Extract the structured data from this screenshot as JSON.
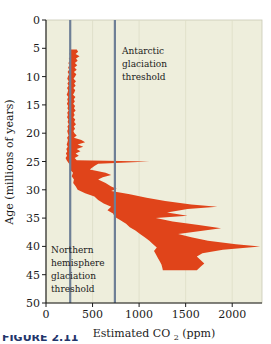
{
  "figure": {
    "background_color": "#ffffff",
    "plot_background_color": "#eeeedc",
    "caption_partial": "FIGURE 2.11"
  },
  "annotations": {
    "antarctic": {
      "line1": "Antarctic",
      "line2": "glaciation",
      "line3": "threshold"
    },
    "northern": {
      "line1": "Northern",
      "line2": "hemisphere",
      "line3": "glaciation",
      "line4": "threshold"
    }
  },
  "chart_data": {
    "type": "area",
    "title": "",
    "subtitle": "",
    "xlabel": "Estimated CO",
    "xlabel_sub": "2",
    "xlabel_unit": "(ppm)",
    "xlabel_full": "Estimated CO2 (ppm)",
    "ylabel": "Age (millions of years)",
    "xlim": [
      0,
      2320
    ],
    "ylim": [
      0,
      50
    ],
    "y_inverted": true,
    "grid": false,
    "legend_position": "none",
    "x_ticks": [
      0,
      500,
      1000,
      1500,
      2000
    ],
    "x_tick_labels": [
      "0",
      "500",
      "1000",
      "1500",
      "2000"
    ],
    "y_ticks": [
      0,
      5,
      10,
      15,
      20,
      25,
      30,
      35,
      40,
      45,
      50
    ],
    "y_tick_labels": [
      "0",
      "5",
      "10",
      "15",
      "20",
      "25",
      "30",
      "35",
      "40",
      "45",
      "50"
    ],
    "band_color": "#e0441a",
    "threshold_color": "#6e7f96",
    "thresholds": [
      {
        "name": "Northern hemisphere glaciation threshold",
        "value": 260
      },
      {
        "name": "Antarctic glaciation threshold",
        "value": 740
      }
    ],
    "series": [
      {
        "name": "Estimated CO2 uncertainty band (lower bound)",
        "axis": "x",
        "points": [
          [
            5.2,
            255
          ],
          [
            5.6,
            262
          ],
          [
            6.0,
            250
          ],
          [
            6.4,
            268
          ],
          [
            6.8,
            245
          ],
          [
            7.2,
            258
          ],
          [
            7.6,
            240
          ],
          [
            8.0,
            252
          ],
          [
            8.4,
            238
          ],
          [
            8.8,
            248
          ],
          [
            9.2,
            232
          ],
          [
            9.6,
            246
          ],
          [
            10.0,
            236
          ],
          [
            10.4,
            228
          ],
          [
            10.8,
            244
          ],
          [
            11.2,
            230
          ],
          [
            11.6,
            242
          ],
          [
            12.0,
            226
          ],
          [
            12.4,
            238
          ],
          [
            12.8,
            232
          ],
          [
            13.2,
            222
          ],
          [
            13.6,
            240
          ],
          [
            14.0,
            228
          ],
          [
            14.4,
            236
          ],
          [
            14.8,
            224
          ],
          [
            15.2,
            238
          ],
          [
            15.6,
            230
          ],
          [
            16.0,
            242
          ],
          [
            16.4,
            228
          ],
          [
            16.8,
            236
          ],
          [
            17.2,
            226
          ],
          [
            17.6,
            240
          ],
          [
            18.0,
            232
          ],
          [
            18.4,
            244
          ],
          [
            18.8,
            230
          ],
          [
            19.2,
            238
          ],
          [
            19.6,
            228
          ],
          [
            20.0,
            234
          ],
          [
            20.4,
            242
          ],
          [
            20.8,
            226
          ],
          [
            21.2,
            236
          ],
          [
            21.6,
            230
          ],
          [
            22.0,
            222
          ],
          [
            22.4,
            234
          ],
          [
            22.8,
            218
          ],
          [
            23.2,
            228
          ],
          [
            23.6,
            214
          ],
          [
            24.0,
            226
          ],
          [
            24.4,
            210
          ],
          [
            24.8,
            222
          ],
          [
            25.2,
            240
          ],
          [
            25.8,
            268
          ],
          [
            26.4,
            256
          ],
          [
            27.0,
            290
          ],
          [
            27.6,
            276
          ],
          [
            28.2,
            300
          ],
          [
            28.8,
            292
          ],
          [
            29.4,
            320
          ],
          [
            30.0,
            340
          ],
          [
            30.6,
            420
          ],
          [
            31.2,
            520
          ],
          [
            31.8,
            560
          ],
          [
            32.4,
            620
          ],
          [
            33.0,
            700
          ],
          [
            33.6,
            660
          ],
          [
            34.2,
            720
          ],
          [
            34.8,
            740
          ],
          [
            35.4,
            800
          ],
          [
            36.0,
            860
          ],
          [
            36.6,
            900
          ],
          [
            37.2,
            960
          ],
          [
            37.8,
            1010
          ],
          [
            38.4,
            1060
          ],
          [
            39.0,
            1110
          ],
          [
            39.6,
            1150
          ],
          [
            40.2,
            1190
          ],
          [
            40.8,
            1160
          ],
          [
            41.4,
            1180
          ],
          [
            42.0,
            1200
          ],
          [
            42.6,
            1220
          ],
          [
            43.2,
            1240
          ],
          [
            43.8,
            1250
          ],
          [
            44.2,
            1255
          ]
        ]
      },
      {
        "name": "Estimated CO2 uncertainty band (upper bound)",
        "axis": "x",
        "points": [
          [
            5.2,
            330
          ],
          [
            5.6,
            345
          ],
          [
            6.0,
            318
          ],
          [
            6.4,
            360
          ],
          [
            6.8,
            322
          ],
          [
            7.2,
            340
          ],
          [
            7.6,
            310
          ],
          [
            8.0,
            336
          ],
          [
            8.4,
            306
          ],
          [
            8.8,
            330
          ],
          [
            9.2,
            300
          ],
          [
            9.6,
            326
          ],
          [
            10.0,
            312
          ],
          [
            10.4,
            296
          ],
          [
            10.8,
            322
          ],
          [
            11.2,
            302
          ],
          [
            11.6,
            318
          ],
          [
            12.0,
            294
          ],
          [
            12.4,
            314
          ],
          [
            12.8,
            304
          ],
          [
            13.2,
            290
          ],
          [
            13.6,
            316
          ],
          [
            14.0,
            298
          ],
          [
            14.4,
            310
          ],
          [
            14.8,
            292
          ],
          [
            15.2,
            312
          ],
          [
            15.6,
            300
          ],
          [
            16.0,
            318
          ],
          [
            16.4,
            296
          ],
          [
            16.8,
            308
          ],
          [
            17.2,
            292
          ],
          [
            17.6,
            314
          ],
          [
            18.0,
            302
          ],
          [
            18.4,
            322
          ],
          [
            18.8,
            298
          ],
          [
            19.2,
            312
          ],
          [
            19.6,
            294
          ],
          [
            20.0,
            306
          ],
          [
            20.4,
            330
          ],
          [
            20.8,
            300
          ],
          [
            21.2,
            380
          ],
          [
            21.6,
            420
          ],
          [
            22.0,
            340
          ],
          [
            22.4,
            400
          ],
          [
            22.8,
            330
          ],
          [
            23.2,
            370
          ],
          [
            23.6,
            318
          ],
          [
            24.0,
            352
          ],
          [
            24.4,
            308
          ],
          [
            24.8,
            330
          ],
          [
            25.0,
            1110
          ],
          [
            25.4,
            560
          ],
          [
            25.8,
            520
          ],
          [
            26.4,
            470
          ],
          [
            27.0,
            640
          ],
          [
            27.4,
            700
          ],
          [
            27.8,
            610
          ],
          [
            28.2,
            560
          ],
          [
            28.8,
            640
          ],
          [
            29.4,
            700
          ],
          [
            29.8,
            760
          ],
          [
            30.2,
            700
          ],
          [
            30.8,
            900
          ],
          [
            31.4,
            1080
          ],
          [
            32.0,
            1280
          ],
          [
            32.6,
            1560
          ],
          [
            33.0,
            1840
          ],
          [
            33.4,
            1520
          ],
          [
            34.0,
            1300
          ],
          [
            34.6,
            1520
          ],
          [
            35.0,
            1180
          ],
          [
            35.6,
            1360
          ],
          [
            36.2,
            1640
          ],
          [
            36.8,
            1880
          ],
          [
            37.2,
            1700
          ],
          [
            37.8,
            1420
          ],
          [
            38.4,
            1560
          ],
          [
            39.0,
            1740
          ],
          [
            39.6,
            2040
          ],
          [
            40.0,
            2300
          ],
          [
            40.6,
            1900
          ],
          [
            41.2,
            1680
          ],
          [
            41.8,
            1620
          ],
          [
            42.4,
            1660
          ],
          [
            43.0,
            1700
          ],
          [
            43.6,
            1660
          ],
          [
            44.2,
            1620
          ]
        ]
      }
    ]
  }
}
